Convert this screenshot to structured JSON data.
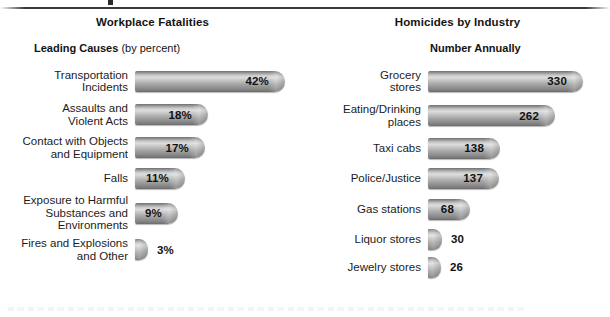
{
  "decor": {
    "top_rule": "horizontal-rule",
    "bottom_ghost": "cut-off-caption"
  },
  "left_panel": {
    "title": "Workplace Fatalities",
    "subtitle_strong": "Leading Causes",
    "subtitle_light": " (by percent)"
  },
  "right_panel": {
    "title": "Homicides by Industry",
    "subtitle_strong": "Number Annually",
    "subtitle_light": ""
  },
  "chart_data": [
    {
      "type": "bar",
      "orientation": "horizontal",
      "title": "Workplace Fatalities",
      "subtitle": "Leading Causes (by percent)",
      "xlabel": "",
      "ylabel": "",
      "unit": "percent",
      "value_suffix": "%",
      "grid": false,
      "legend": "none",
      "xlim": [
        0,
        42
      ],
      "categories": [
        "Transportation\nIncidents",
        "Assaults and\nViolent Acts",
        "Contact with Objects\nand Equipment",
        "Falls",
        "Exposure to Harmful\nSubstances and\nEnvironments",
        "Fires and Explosions\nand Other"
      ],
      "values": [
        42,
        18,
        17,
        11,
        9,
        3
      ],
      "labels": [
        "42%",
        "18%",
        "17%",
        "11%",
        "9%",
        "3%"
      ],
      "label_position": [
        "inside",
        "inside",
        "inside",
        "inside",
        "inside",
        "outside"
      ]
    },
    {
      "type": "bar",
      "orientation": "horizontal",
      "title": "Homicides by Industry",
      "subtitle": "Number Annually",
      "xlabel": "",
      "ylabel": "",
      "unit": "count",
      "value_suffix": "",
      "grid": false,
      "legend": "none",
      "xlim": [
        0,
        330
      ],
      "categories": [
        "Grocery\nstores",
        "Eating/Drinking\nplaces",
        "Taxi cabs",
        "Police/Justice",
        "Gas stations",
        "Liquor stores",
        "Jewelry stores"
      ],
      "values": [
        330,
        262,
        138,
        137,
        68,
        30,
        26
      ],
      "labels": [
        "330",
        "262",
        "138",
        "137",
        "68",
        "30",
        "26"
      ],
      "label_position": [
        "inside",
        "inside",
        "inside",
        "inside",
        "inside",
        "outside",
        "outside"
      ]
    }
  ],
  "layout": {
    "left_bar_px": [
      150,
      73,
      70,
      50,
      43,
      13
    ],
    "right_bar_px": [
      155,
      127,
      72,
      71,
      42,
      14,
      13
    ],
    "left_row_h": [
      34,
      33,
      33,
      28,
      42,
      31
    ],
    "right_row_h": [
      34,
      35,
      30,
      30,
      32,
      28,
      28
    ]
  },
  "colors": {
    "bar_light": "#dcdcdc",
    "bar_mid": "#a5a5a5",
    "bar_dark": "#6a6a6a",
    "text": "#1c1c1c",
    "rule": "#3a3a3a"
  }
}
